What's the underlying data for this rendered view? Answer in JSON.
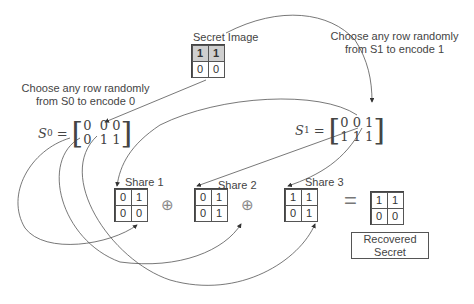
{
  "secret_image": {
    "title": "Secret Image",
    "cells": [
      [
        "1",
        "1"
      ],
      [
        "0",
        "0"
      ]
    ],
    "shaded_row": 0
  },
  "annotations": {
    "s0_note": [
      "Choose any row randomly",
      "from S0 to encode 0"
    ],
    "s1_note": [
      "Choose any row randomly",
      "from S1 to encode 1"
    ]
  },
  "matrices": {
    "s0": {
      "label": "S",
      "superscript": "0",
      "eq": "=",
      "rows": [
        "0  0 0",
        "0  1 1"
      ]
    },
    "s1": {
      "label": "S",
      "superscript": "1",
      "eq": "=",
      "rows": [
        "0 0 1",
        "1 1 1"
      ]
    }
  },
  "shares": [
    {
      "title": "Share 1",
      "cells": [
        [
          "0",
          "1"
        ],
        [
          "0",
          "0"
        ]
      ]
    },
    {
      "title": "Share 2",
      "cells": [
        [
          "0",
          "1"
        ],
        [
          "0",
          "1"
        ]
      ]
    },
    {
      "title": "Share 3",
      "cells": [
        [
          "1",
          "1"
        ],
        [
          "0",
          "1"
        ]
      ]
    }
  ],
  "operators": {
    "xor": "⊕",
    "equals": "="
  },
  "recovered": {
    "cells": [
      [
        "1",
        "1"
      ],
      [
        "0",
        "0"
      ]
    ],
    "caption": [
      "Recovered",
      "Secret"
    ]
  },
  "colors": {
    "line": "#444444",
    "shaded_cell": "#cfcfcf",
    "operator": "#888888"
  }
}
